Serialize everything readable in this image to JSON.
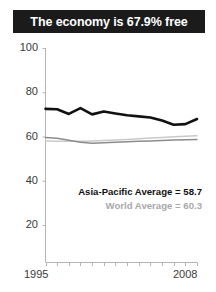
{
  "title": {
    "text": "The economy is 67.9% free"
  },
  "annotations": {
    "asia_pacific": "Asia-Pacific Average = 58.7",
    "world": "World Average = 60.3"
  },
  "axis": {
    "y_ticks": [
      "100",
      "80",
      "60",
      "40",
      "20"
    ],
    "x_start": "1995",
    "x_end": "2008"
  },
  "colors": {
    "banner_bg": "#1b1b1b",
    "banner_text": "#ffffff",
    "economy_line": "#111111",
    "asia_line": "#8c8c8c",
    "world_line": "#c9c9c9",
    "axis": "#b5b5b5",
    "tick_text": "#3a3a3a"
  },
  "chart_data": {
    "type": "line",
    "title": "The economy is 67.9% free",
    "xlabel": "",
    "ylabel": "",
    "xlim": [
      1995,
      2008
    ],
    "ylim": [
      0,
      100
    ],
    "yticks": [
      20,
      40,
      60,
      80,
      100
    ],
    "xticks": [
      1995,
      1996,
      1997,
      1998,
      1999,
      2000,
      2001,
      2002,
      2003,
      2004,
      2005,
      2006,
      2007,
      2008
    ],
    "grid": false,
    "legend": "none",
    "x": [
      1995,
      1996,
      1997,
      1998,
      1999,
      2000,
      2001,
      2002,
      2003,
      2004,
      2005,
      2006,
      2007,
      2008
    ],
    "series": [
      {
        "name": "Economy",
        "color": "#111111",
        "width": 2.6,
        "values": [
          72.5,
          72.3,
          70.2,
          72.8,
          70.0,
          71.3,
          70.4,
          69.6,
          69.1,
          68.6,
          67.2,
          65.3,
          65.6,
          67.9
        ]
      },
      {
        "name": "Asia-Pacific Average",
        "color": "#8c8c8c",
        "width": 1.5,
        "values": [
          59.6,
          59.2,
          58.3,
          57.4,
          57.0,
          57.2,
          57.4,
          57.6,
          57.8,
          58.0,
          58.2,
          58.4,
          58.5,
          58.7
        ]
      },
      {
        "name": "World Average",
        "color": "#c9c9c9",
        "width": 1.5,
        "values": [
          58.0,
          57.9,
          57.8,
          57.9,
          58.0,
          58.2,
          58.4,
          58.7,
          59.0,
          59.3,
          59.6,
          59.9,
          60.1,
          60.3
        ]
      }
    ],
    "annotations": [
      {
        "text": "Asia-Pacific Average = 58.7",
        "color": "#111111"
      },
      {
        "text": "World Average = 60.3",
        "color": "#a8a8a8"
      }
    ]
  }
}
